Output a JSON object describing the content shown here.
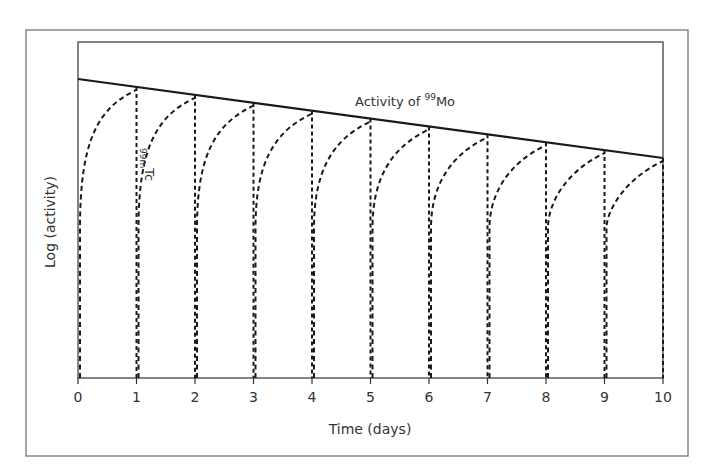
{
  "chart_data": {
    "type": "line",
    "title": "",
    "xlabel": "Time (days)",
    "ylabel": "Log (activity)",
    "x_ticks": [
      0,
      1,
      2,
      3,
      4,
      5,
      6,
      7,
      8,
      9,
      10
    ],
    "xlim": [
      0,
      10
    ],
    "y_scale": "log (unlabeled)",
    "grid": false,
    "legend": "none (inline annotations)",
    "annotations": [
      {
        "text": "Activity of ",
        "superscript": "99",
        "suffix": "Mo",
        "near_x": 5.3
      },
      {
        "text": "Tc",
        "superscript": "99m",
        "near_x": 1.15,
        "rotated": true
      }
    ],
    "series": [
      {
        "name": "Activity of 99Mo",
        "style": "solid",
        "x": [
          0,
          10
        ],
        "relative_log_y": [
          0.87,
          0.65
        ],
        "description": "Straight line on log scale (exponential decay of parent)"
      },
      {
        "name": "99mTc",
        "style": "dashed",
        "description": "Daily elution: Tc activity builds up from ~0 each day and approaches the 99Mo line, then drops to zero at each elution (days 1-10)",
        "elution_days": [
          1,
          2,
          3,
          4,
          5,
          6,
          7,
          8,
          9,
          10
        ]
      }
    ]
  },
  "axes": {
    "x_title": "Time (days)",
    "y_title": "Log (activity)",
    "x_tick_labels": [
      "0",
      "1",
      "2",
      "3",
      "4",
      "5",
      "6",
      "7",
      "8",
      "9",
      "10"
    ]
  },
  "labels": {
    "mo_prefix": "Activity of ",
    "mo_sup": "99",
    "mo_suffix": "Mo",
    "tc_sup": "99m",
    "tc_suffix": "Tc"
  }
}
